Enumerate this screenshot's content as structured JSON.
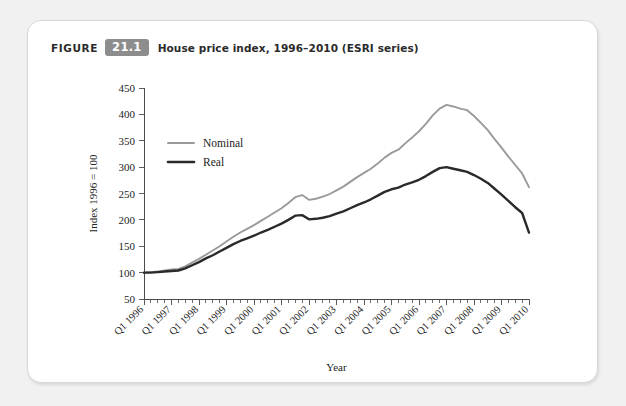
{
  "figure": {
    "label": "FIGURE",
    "number": "21.1",
    "caption": "House price index, 1996–2010 (ESRI series)",
    "badge_color": "#8d8d8d"
  },
  "chart_data": {
    "type": "line",
    "title": "House price index, 1996–2010 (ESRI series)",
    "xlabel": "Year",
    "ylabel": "Index 1996 = 100",
    "ylim": [
      50,
      450
    ],
    "ytick_labels": [
      "50",
      "100",
      "150",
      "200",
      "250",
      "300",
      "350",
      "400",
      "450"
    ],
    "ytick_values": [
      50,
      100,
      150,
      200,
      250,
      300,
      350,
      400,
      450
    ],
    "grid": false,
    "legend_position": "upper-left-inside",
    "categories": [
      "Q1 1996",
      "Q2 1996",
      "Q3 1996",
      "Q4 1996",
      "Q1 1997",
      "Q2 1997",
      "Q3 1997",
      "Q4 1997",
      "Q1 1998",
      "Q2 1998",
      "Q3 1998",
      "Q4 1998",
      "Q1 1999",
      "Q2 1999",
      "Q3 1999",
      "Q4 1999",
      "Q1 2000",
      "Q2 2000",
      "Q3 2000",
      "Q4 2000",
      "Q1 2001",
      "Q2 2001",
      "Q3 2001",
      "Q4 2001",
      "Q1 2002",
      "Q2 2002",
      "Q3 2002",
      "Q4 2002",
      "Q1 2003",
      "Q2 2003",
      "Q3 2003",
      "Q4 2003",
      "Q1 2004",
      "Q2 2004",
      "Q3 2004",
      "Q4 2004",
      "Q1 2005",
      "Q2 2005",
      "Q3 2005",
      "Q4 2005",
      "Q1 2006",
      "Q2 2006",
      "Q3 2006",
      "Q4 2006",
      "Q1 2007",
      "Q2 2007",
      "Q3 2007",
      "Q4 2007",
      "Q1 2008",
      "Q2 2008",
      "Q3 2008",
      "Q4 2008",
      "Q1 2009",
      "Q2 2009",
      "Q3 2009",
      "Q4 2009",
      "Q1 2010"
    ],
    "xtick_labels": [
      "Q1 1996",
      "Q1 1997",
      "Q1 1998",
      "Q1 1999",
      "Q1 2000",
      "Q1 2001",
      "Q1 2002",
      "Q1 2003",
      "Q1 2004",
      "Q1 2005",
      "Q1 2006",
      "Q1 2007",
      "Q1 2008",
      "Q1 2009",
      "Q1 2010"
    ],
    "series": [
      {
        "name": "Nominal",
        "color": "#9a9a9a",
        "values": [
          100,
          101,
          102,
          104,
          106,
          107,
          112,
          119,
          126,
          134,
          142,
          150,
          159,
          168,
          176,
          183,
          190,
          198,
          206,
          214,
          222,
          232,
          243,
          247,
          238,
          240,
          244,
          249,
          256,
          263,
          272,
          281,
          289,
          297,
          307,
          318,
          327,
          333,
          345,
          356,
          368,
          382,
          398,
          411,
          418,
          415,
          411,
          408,
          397,
          384,
          370,
          353,
          337,
          320,
          304,
          288,
          262
        ]
      },
      {
        "name": "Real",
        "color": "#2a2a2a",
        "values": [
          100,
          100,
          101,
          102,
          103,
          104,
          108,
          114,
          120,
          127,
          133,
          140,
          147,
          154,
          160,
          165,
          170,
          176,
          181,
          187,
          193,
          200,
          208,
          209,
          201,
          202,
          204,
          207,
          212,
          216,
          222,
          228,
          233,
          239,
          246,
          253,
          258,
          261,
          267,
          271,
          276,
          283,
          291,
          298,
          300,
          297,
          294,
          291,
          285,
          278,
          270,
          259,
          248,
          236,
          224,
          213,
          176
        ]
      }
    ]
  },
  "legend": {
    "items": [
      {
        "label": "Nominal",
        "color": "#9a9a9a"
      },
      {
        "label": "Real",
        "color": "#2a2a2a"
      }
    ]
  }
}
